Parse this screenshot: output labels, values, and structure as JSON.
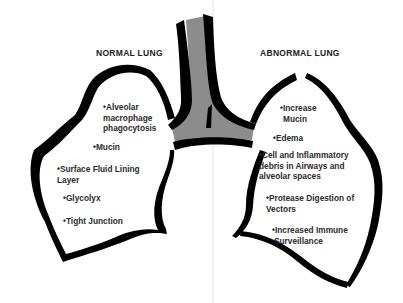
{
  "diagram": {
    "colors": {
      "outline": "#000000",
      "airway_fill": "#8c8c8c",
      "background": "#ffffff",
      "divider": "#e6e6e6",
      "text": "#2a2a2a"
    },
    "normal_lung": {
      "title": "NORMAL LUNG",
      "items": [
        {
          "bullet": "•",
          "lines": [
            "Alveolar",
            "macrophage",
            "phagocytosis"
          ]
        },
        {
          "bullet": "•",
          "lines": [
            "Mucin"
          ]
        },
        {
          "bullet": "•",
          "lines": [
            "Surface Fluid Lining",
            "Layer"
          ]
        },
        {
          "bullet": "•",
          "lines": [
            "Glycolyx"
          ]
        },
        {
          "bullet": "•",
          "lines": [
            "Tight Junction"
          ]
        }
      ]
    },
    "abnormal_lung": {
      "title": "ABNORMAL LUNG",
      "items": [
        {
          "bullet": "•",
          "lines": [
            "Increase",
            "Mucin"
          ]
        },
        {
          "bullet": "•",
          "lines": [
            "Edema"
          ]
        },
        {
          "bullet": "•",
          "lines": [
            "Cell and Inflammatory",
            "debris in Airways and",
            "alveolar spaces"
          ]
        },
        {
          "bullet": "•",
          "lines": [
            "Protease Digestion of",
            "Vectors"
          ]
        },
        {
          "bullet": "•",
          "lines": [
            "Increased Immune",
            "Surveillance"
          ]
        }
      ]
    }
  }
}
